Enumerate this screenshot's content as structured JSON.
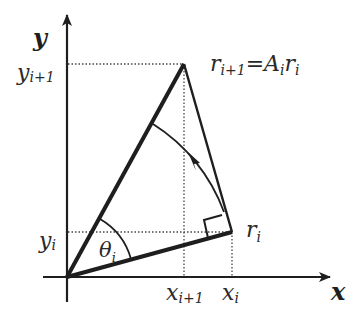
{
  "diagram": {
    "axes": {
      "x_label": "x",
      "y_label": "y"
    },
    "labels": {
      "equation": {
        "r": "r",
        "r_sub": "i+1",
        "eq": "=",
        "A": "A",
        "A_sub": "i",
        "r2": "r",
        "r2_sub": "i"
      },
      "r_i": {
        "base": "r",
        "sub": "i"
      },
      "theta_i": {
        "base": "θ",
        "sub": "i"
      },
      "y_i1": {
        "base": "y",
        "sub": "i+1"
      },
      "y_i": {
        "base": "y",
        "sub": "i"
      },
      "x_i1": {
        "base": "x",
        "sub": "i+1"
      },
      "x_i": {
        "base": "x",
        "sub": "i"
      }
    },
    "points": {
      "origin": [
        67,
        277
      ],
      "r_i": [
        232,
        232
      ],
      "r_i1": [
        184,
        64
      ]
    },
    "colors": {
      "stroke": "#1e1e1e",
      "text": "#2a2a2a",
      "background": "#ffffff"
    }
  }
}
